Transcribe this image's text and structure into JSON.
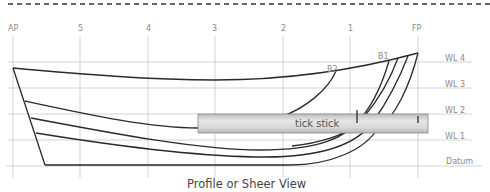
{
  "diagram": {
    "title": "Profile or Sheer View",
    "stations": [
      {
        "label": "AP",
        "x": 13
      },
      {
        "label": "5",
        "x": 80
      },
      {
        "label": "4",
        "x": 148
      },
      {
        "label": "3",
        "x": 215
      },
      {
        "label": "2",
        "x": 283
      },
      {
        "label": "1",
        "x": 350
      },
      {
        "label": "FP",
        "x": 418
      }
    ],
    "waterlines": [
      {
        "label": "WL 4",
        "y": 62
      },
      {
        "label": "WL 3",
        "y": 88
      },
      {
        "label": "WL 2",
        "y": 114
      },
      {
        "label": "WL 1",
        "y": 140
      },
      {
        "label": "Datum",
        "y": 166
      }
    ],
    "buttock_labels": [
      {
        "label": "B1",
        "x": 378,
        "y": 56
      },
      {
        "label": "B2",
        "x": 328,
        "y": 69
      }
    ],
    "tick_stick": {
      "label": "tick stick"
    },
    "colors": {
      "grid": "#c8c8c8",
      "hull_line": "#2a2a2a",
      "dash": "#333333",
      "stick_fill": "#d6d6d6",
      "stick_border": "#8a8a8a"
    }
  }
}
